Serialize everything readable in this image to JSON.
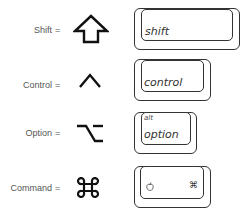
{
  "rows": [
    {
      "modifier": "Shift",
      "equals": "=",
      "symbol_icon": "shift-arrow-icon",
      "key_label": "shift"
    },
    {
      "modifier": "Control",
      "equals": "=",
      "symbol_icon": "control-caret-icon",
      "key_label": "control"
    },
    {
      "modifier": "Option",
      "equals": "=",
      "symbol_icon": "option-icon",
      "key_label": "option",
      "key_sublabel": "alt"
    },
    {
      "modifier": "Command",
      "equals": "=",
      "symbol_icon": "command-icon",
      "key_label_left_icon": "apple-logo-icon",
      "key_label_right": "⌘"
    }
  ],
  "colors": {
    "stroke": "#333333",
    "label": "#555555",
    "background": "#ffffff"
  }
}
